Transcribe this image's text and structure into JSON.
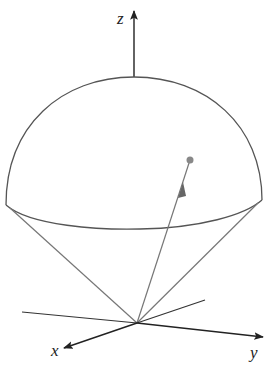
{
  "figure": {
    "axes": {
      "x_label": "x",
      "y_label": "y",
      "z_label": "z"
    },
    "colors": {
      "stroke": "#555555",
      "axis": "#222222",
      "point": "#777777"
    }
  }
}
